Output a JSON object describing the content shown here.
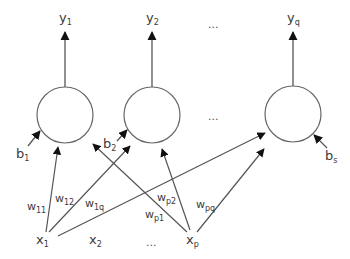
{
  "diagram": {
    "type": "single-layer neural network",
    "colors": {
      "stroke": "#555555",
      "text": "#3a3a3a",
      "background": "#ffffff"
    },
    "outputs": [
      {
        "base": "y",
        "sub": "1"
      },
      {
        "base": "y",
        "sub": "2"
      },
      {
        "ellipsis": "..."
      },
      {
        "base": "y",
        "sub": "q"
      }
    ],
    "neurons": [
      {
        "id": "n1"
      },
      {
        "id": "n2"
      },
      {
        "ellipsis": "..."
      },
      {
        "id": "nq"
      }
    ],
    "biases": [
      {
        "base": "b",
        "sub": "1"
      },
      {
        "base": "b",
        "sub": "2"
      },
      {
        "base": "b",
        "sub": "s"
      }
    ],
    "inputs": [
      {
        "base": "x",
        "sub": "1"
      },
      {
        "base": "x",
        "sub": "2"
      },
      {
        "ellipsis": "..."
      },
      {
        "base": "x",
        "sub": "p"
      }
    ],
    "weights": [
      {
        "base": "w",
        "sub": "11"
      },
      {
        "base": "w",
        "sub": "12"
      },
      {
        "base": "w",
        "sub": "1q"
      },
      {
        "base": "w",
        "sub": "p1"
      },
      {
        "base": "w",
        "sub": "p2"
      },
      {
        "base": "w",
        "sub": "pq"
      }
    ]
  }
}
